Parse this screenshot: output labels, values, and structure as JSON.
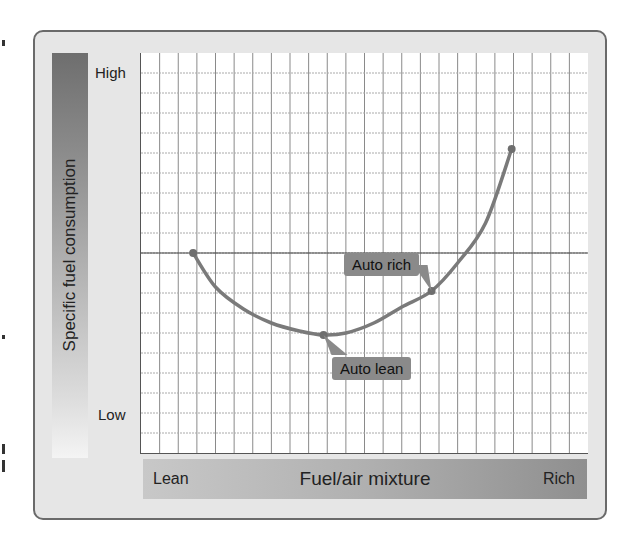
{
  "chart_data": {
    "type": "line",
    "title": "",
    "xlabel": "Fuel/air mixture",
    "ylabel": "Specific fuel consumption",
    "x_tick_labels": [
      "Lean",
      "Rich"
    ],
    "y_tick_labels": [
      "High",
      "Low"
    ],
    "grid": true,
    "grid_columns": 24,
    "grid_rows": 20,
    "xlim": [
      0,
      24
    ],
    "ylim": [
      0,
      20
    ],
    "series": [
      {
        "name": "Specific fuel consumption curve",
        "color": "#7a7a7a",
        "x": [
          2.8,
          4.0,
          5.5,
          7.0,
          8.5,
          9.8,
          11.0,
          12.5,
          14.0,
          15.6,
          17.0,
          18.5,
          19.9
        ],
        "y": [
          10.0,
          8.3,
          7.2,
          6.5,
          6.1,
          5.9,
          6.0,
          6.5,
          7.3,
          8.1,
          9.5,
          11.5,
          15.2
        ]
      }
    ],
    "reference_line": {
      "y": 10.0,
      "orientation": "horizontal"
    },
    "annotations": [
      {
        "text": "Auto lean",
        "x": 9.8,
        "y": 5.9
      },
      {
        "text": "Auto rich",
        "x": 15.6,
        "y": 8.1
      }
    ]
  },
  "axis": {
    "y_title": "Specific fuel consumption",
    "y_high": "High",
    "y_low": "Low",
    "x_title": "Fuel/air mixture",
    "x_lean": "Lean",
    "x_rich": "Rich"
  },
  "callouts": {
    "auto_lean": "Auto lean",
    "auto_rich": "Auto rich"
  },
  "colors": {
    "frame_bg": "#e6e6e6",
    "curve": "#7a7a7a",
    "callout_bg": "#8a8a8a",
    "grid": "#9a9a9a"
  }
}
